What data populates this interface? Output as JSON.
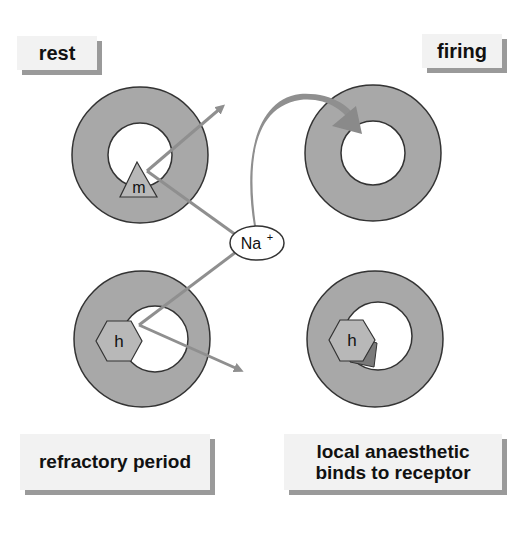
{
  "diagram": {
    "colors": {
      "background": "#ffffff",
      "ring_fill": "#a8a8a8",
      "ring_stroke": "#333333",
      "arrow": "#8f8f8f",
      "gate_fill": "#b8b8b8",
      "label_bg": "#f2f2f2",
      "label_shadow": "#9a9a9a"
    },
    "labels": {
      "rest": "rest",
      "firing": "firing",
      "refractory": "refractory period",
      "anaesthetic_line1": "local anaesthetic",
      "anaesthetic_line2": "binds to receptor"
    },
    "ion": {
      "symbol": "Na",
      "charge": "+"
    },
    "gates": {
      "m": "m",
      "h_refractory": "h",
      "h_bound": "h"
    },
    "channels": [
      {
        "state": "rest",
        "gate": "m",
        "position": "top-left"
      },
      {
        "state": "firing",
        "gate": "none",
        "position": "top-right"
      },
      {
        "state": "refractory period",
        "gate": "h",
        "position": "bottom-left"
      },
      {
        "state": "local anaesthetic binds to receptor",
        "gate": "h + drug",
        "position": "bottom-right"
      }
    ]
  }
}
